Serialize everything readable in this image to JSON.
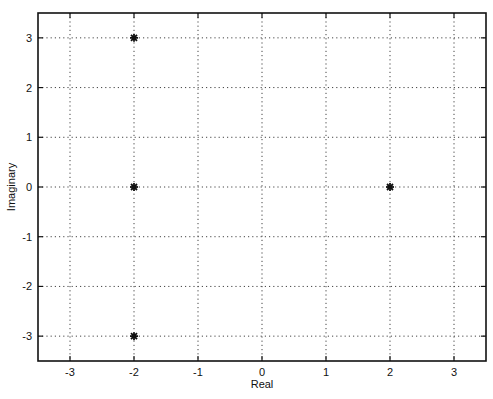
{
  "chart_data": {
    "type": "scatter",
    "title": "",
    "xlabel": "Real",
    "ylabel": "Imaginary",
    "xlim": [
      -3.5,
      3.5
    ],
    "ylim": [
      -3.5,
      3.5
    ],
    "xticks": [
      -3,
      -2,
      -1,
      0,
      1,
      2,
      3
    ],
    "yticks": [
      -3,
      -2,
      -1,
      0,
      1,
      2,
      3
    ],
    "xtick_labels": [
      "-3",
      "-2",
      "-1",
      "0",
      "1",
      "2",
      "3"
    ],
    "ytick_labels": [
      "-3",
      "-2",
      "-1",
      "0",
      "1",
      "2",
      "3"
    ],
    "grid": true,
    "grid_style": "dotted",
    "legend": null,
    "series": [
      {
        "name": "poles",
        "marker": "asterisk",
        "color": "#111111",
        "points": [
          {
            "x": -2,
            "y": 3
          },
          {
            "x": -2,
            "y": 0
          },
          {
            "x": -2,
            "y": -3
          },
          {
            "x": 2,
            "y": 0
          }
        ]
      }
    ]
  }
}
